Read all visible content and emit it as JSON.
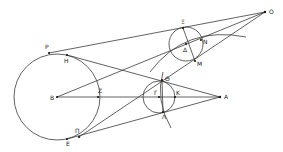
{
  "diagram": {
    "type": "geometric-construction",
    "labels": {
      "O": "O",
      "P": "P",
      "H": "H",
      "B": "B",
      "Z": "Z",
      "Pi": "Π",
      "E": "E",
      "Xi": "Ξ",
      "Delta": "Δ",
      "N": "N",
      "M": "M",
      "Theta": "Θ",
      "Gamma": "Γ",
      "K": "K",
      "Lambda": "Λ",
      "A": "A"
    },
    "points": {
      "O": [
        265,
        12
      ],
      "P": [
        49,
        53
      ],
      "H": [
        67,
        55
      ],
      "B": [
        57,
        97
      ],
      "Z": [
        98,
        97
      ],
      "Pi": [
        79,
        137
      ],
      "E": [
        67,
        139
      ],
      "Xi": [
        183,
        28
      ],
      "Delta": [
        186,
        44
      ],
      "N": [
        201,
        40
      ],
      "M": [
        195,
        61
      ],
      "Theta": [
        162,
        80
      ],
      "Gamma": [
        159,
        97
      ],
      "K": [
        175,
        97
      ],
      "Lambda": [
        163,
        112
      ],
      "A": [
        220,
        97
      ]
    },
    "circles": [
      {
        "name": "large-circle-B",
        "center": "B",
        "r": 43
      },
      {
        "name": "circle-Delta",
        "center": "Delta",
        "r": 17
      },
      {
        "name": "circle-Gamma",
        "center": "Gamma",
        "r": 16
      }
    ]
  }
}
